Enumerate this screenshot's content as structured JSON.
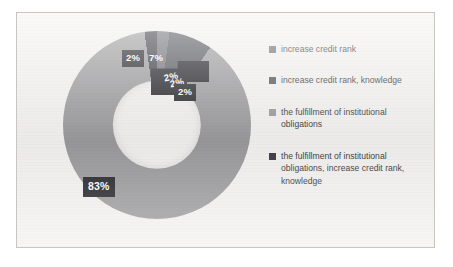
{
  "chart_data": {
    "type": "pie",
    "variant": "donut",
    "title": "",
    "xlabel": "",
    "ylabel": "",
    "legend_position": "right",
    "grid": false,
    "units": "percent",
    "categories": [
      "increase credit rank",
      "increase credit rank, knowledge",
      "the fulfillment of institutional obligations",
      "the fulfillment of institutional obligations, increase credit rank, knowledge"
    ],
    "values": [
      2,
      7,
      83,
      2
    ],
    "data_labels": [
      "2%",
      "7%",
      "2%",
      "2%",
      "83%"
    ],
    "slice_colors": [
      "#6f7076",
      "#53545a",
      "#9a9a9c",
      "#3b3c42"
    ],
    "note": "labels 2% and 2% overlap near the top-right of the donut"
  },
  "legend": {
    "items": [
      {
        "label": "increase credit rank",
        "color": "#6f7076"
      },
      {
        "label": "increase credit rank, knowledge",
        "color": "#53545a"
      },
      {
        "label": "the fulfillment of institutional obligations",
        "color": "#9a9a9c"
      },
      {
        "label": "the fulfillment of institutional obligations, increase credit rank, knowledge",
        "color": "#3b3c42"
      }
    ]
  },
  "labels": {
    "big": "83%",
    "a": "2%",
    "b": "7%",
    "c": "2%",
    "d": "2%",
    "e": "2%"
  },
  "colors": {
    "frame_bg": "#f3f2f0",
    "frame_border": "#c9c6c2",
    "label_bg": "#24242a",
    "label_fg": "#ffffff",
    "legend_text": "#3a3a3c"
  }
}
